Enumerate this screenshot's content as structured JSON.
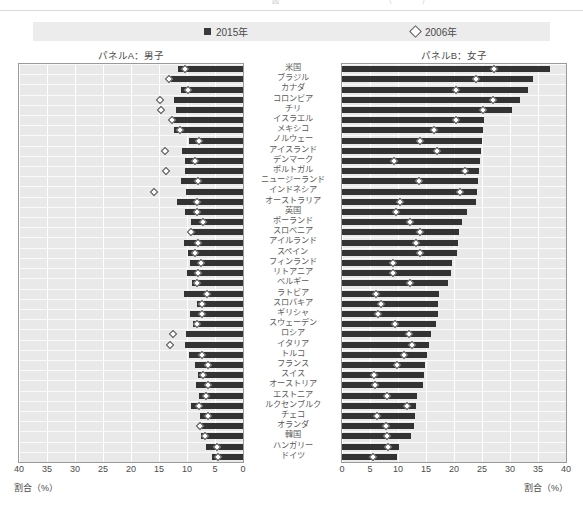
{
  "top_caption": "図　　　　　　　　　　　　　　　（　　　　）",
  "legend": {
    "series": [
      {
        "label": "2015年",
        "marker": "filled-square",
        "color": "#333333"
      },
      {
        "label": "2006年",
        "marker": "open-diamond",
        "color": "#ffffff"
      }
    ]
  },
  "panels": {
    "left_title": "パネルA：男子",
    "right_title": "パネルB：女子"
  },
  "axis": {
    "left_ticks": [
      "40",
      "35",
      "30",
      "25",
      "20",
      "15",
      "10",
      "5",
      "0"
    ],
    "right_ticks": [
      "0",
      "5",
      "10",
      "15",
      "20",
      "25",
      "30",
      "35",
      "40"
    ],
    "left_label": "割合（%）",
    "right_label": "割合（%）"
  },
  "chart_data": {
    "type": "bar",
    "xlabel": "割合（%）",
    "ylabel": "",
    "xlim": [
      0,
      40
    ],
    "grid": true,
    "legend_position": "top",
    "orientation": "horizontal-paired",
    "categories": [
      "米国",
      "ブラジル",
      "カナダ",
      "コロンビア",
      "チリ",
      "イスラエル",
      "メキシコ",
      "ノルウェー",
      "アイスランド",
      "デンマーク",
      "ポルトガル",
      "ニュージーランド",
      "インドネシア",
      "オーストラリア",
      "英国",
      "ポーランド",
      "スロベニア",
      "アイルランド",
      "スペイン",
      "フィンランド",
      "リトアニア",
      "ベルギー",
      "ラトビア",
      "スロバキア",
      "ギリシャ",
      "スウェーデン",
      "ロシア",
      "イタリア",
      "トルコ",
      "フランス",
      "スイス",
      "オーストリア",
      "エストニア",
      "ルクセンブルク",
      "チェコ",
      "オランダ",
      "韓国",
      "ハンガリー",
      "ドイツ"
    ],
    "panelA_male": {
      "label": "パネルA：男子",
      "axis_direction": "right-to-left",
      "series": [
        {
          "name": "2015年",
          "values": [
            11.6,
            12.9,
            11.1,
            12.4,
            12.0,
            12.6,
            12.4,
            9.6,
            10.9,
            10.3,
            10.4,
            11.0,
            10.1,
            11.7,
            10.4,
            9.3,
            9.1,
            10.5,
            9.8,
            9.4,
            10.0,
            9.1,
            10.6,
            8.2,
            9.5,
            8.9,
            10.1,
            10.3,
            9.7,
            8.6,
            8.1,
            8.4,
            7.9,
            9.3,
            7.7,
            8.1,
            7.5,
            6.6,
            5.5
          ]
        },
        {
          "name": "2006年",
          "values": [
            10.3,
            13.3,
            9.8,
            14.8,
            14.6,
            12.7,
            11.3,
            7.8,
            14.0,
            8.5,
            13.8,
            8.0,
            15.9,
            8.2,
            8.3,
            7.2,
            9.3,
            8.0,
            8.6,
            7.5,
            8.1,
            8.3,
            6.5,
            7.3,
            7.4,
            8.2,
            12.5,
            13.0,
            7.3,
            6.3,
            7.1,
            6.2,
            6.6,
            7.9,
            6.3,
            7.6,
            6.8,
            4.6,
            4.5
          ]
        }
      ]
    },
    "panelB_female": {
      "label": "パネルB：女子",
      "axis_direction": "left-to-right",
      "series": [
        {
          "name": "2015年",
          "values": [
            37.2,
            34.1,
            33.3,
            31.8,
            30.3,
            25.4,
            25.2,
            25.0,
            24.8,
            24.7,
            24.4,
            24.2,
            24.1,
            23.9,
            22.3,
            21.4,
            20.9,
            20.7,
            20.6,
            19.6,
            19.5,
            19.0,
            17.3,
            17.1,
            17.1,
            16.8,
            15.9,
            15.6,
            15.1,
            14.8,
            14.6,
            14.5,
            13.4,
            13.2,
            13.0,
            12.8,
            12.4,
            10.2,
            9.8
          ]
        },
        {
          "name": "2006年",
          "values": [
            27.2,
            24.0,
            20.3,
            27.0,
            25.1,
            20.4,
            16.5,
            13.9,
            17.0,
            9.3,
            22.0,
            13.7,
            21.0,
            10.4,
            9.6,
            12.2,
            13.9,
            13.2,
            13.9,
            9.1,
            9.1,
            12.2,
            6.0,
            6.9,
            6.4,
            9.5,
            11.9,
            12.5,
            11.0,
            9.8,
            5.8,
            5.9,
            8.1,
            11.6,
            6.2,
            7.8,
            8.1,
            8.3,
            5.6
          ]
        }
      ]
    }
  }
}
